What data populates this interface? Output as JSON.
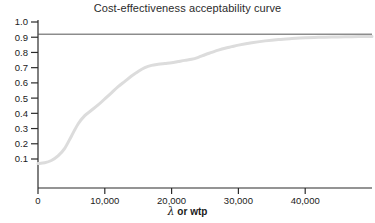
{
  "chart_data": {
    "type": "line",
    "title": "Cost-effectiveness acceptability curve",
    "xlabel_lambda": "λ",
    "xlabel_rest": " or wtp",
    "xlabel": "λ or wtp",
    "ylabel": "",
    "xlim": [
      0,
      50000
    ],
    "ylim": [
      0,
      1.0
    ],
    "grid": false,
    "legend": "none",
    "xticks": [
      0,
      10000,
      20000,
      30000,
      40000
    ],
    "xticklabels": [
      "0",
      "10,000",
      "20,000",
      "30,000",
      "40,000"
    ],
    "yticks": [
      0.1,
      0.2,
      0.3,
      0.4,
      0.5,
      0.6,
      0.7,
      0.8,
      0.9,
      1.0
    ],
    "yticklabels": [
      "0.1",
      "0.2",
      "0.3",
      "0.4",
      "0.5",
      "0.6",
      "0.7",
      "0.8",
      "0.9",
      "1.0"
    ],
    "series": [
      {
        "name": "acceptability-curve",
        "color": "#dcdcdc",
        "linewidth": 3,
        "x": [
          0,
          1000,
          2000,
          3000,
          4000,
          5000,
          6000,
          7000,
          8000,
          9000,
          10000,
          11000,
          12000,
          13000,
          14000,
          15000,
          16000,
          17000,
          18000,
          19000,
          20000,
          21000,
          22000,
          23000,
          24000,
          25000,
          26000,
          27000,
          28000,
          29000,
          30000,
          32000,
          34000,
          36000,
          38000,
          40000,
          42000,
          44000,
          46000,
          48000,
          50000
        ],
        "values": [
          0.07,
          0.075,
          0.09,
          0.12,
          0.17,
          0.25,
          0.33,
          0.385,
          0.42,
          0.455,
          0.495,
          0.535,
          0.575,
          0.61,
          0.645,
          0.675,
          0.7,
          0.715,
          0.722,
          0.727,
          0.732,
          0.74,
          0.748,
          0.755,
          0.768,
          0.785,
          0.8,
          0.815,
          0.828,
          0.838,
          0.848,
          0.864,
          0.876,
          0.885,
          0.891,
          0.896,
          0.899,
          0.901,
          0.903,
          0.904,
          0.905
        ]
      }
    ],
    "reference_lines": [
      {
        "name": "asymptote-line",
        "orientation": "horizontal",
        "value": 0.92,
        "color": "#555555",
        "linewidth": 1
      }
    ]
  }
}
